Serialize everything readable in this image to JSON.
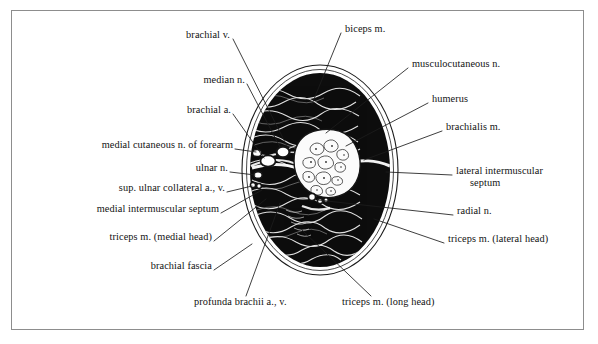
{
  "figure": {
    "type": "anatomical-cross-section",
    "border_color": "#8d8d8d",
    "background_color": "#ffffff",
    "ink_color": "#121212"
  },
  "specimen": {
    "outline_shape": "oval",
    "muscle_fill": "#0d0d0d",
    "fascia_fill": "#ffffff",
    "bone_fill": "#fcfcfc",
    "center_x": 320,
    "center_y": 170,
    "radius_x": 78,
    "radius_y": 105
  },
  "labels": [
    {
      "id": "brachial-v",
      "text": "brachial v.",
      "side": "left",
      "x": 228,
      "y": 35,
      "anchor": "end"
    },
    {
      "id": "median-n",
      "text": "median n.",
      "side": "left",
      "x": 243,
      "y": 80,
      "anchor": "end"
    },
    {
      "id": "brachial-a",
      "text": "brachial a.",
      "side": "left",
      "x": 229,
      "y": 110,
      "anchor": "end"
    },
    {
      "id": "medial-cutaneous-n-forearm",
      "text": "medial cutaneous n. of forearm",
      "side": "left",
      "x": 231,
      "y": 145,
      "anchor": "end"
    },
    {
      "id": "ulnar-n",
      "text": "ulnar n.",
      "side": "left",
      "x": 226,
      "y": 168,
      "anchor": "end"
    },
    {
      "id": "sup-ulnar-collateral",
      "text": "sup. ulnar collateral a., v.",
      "side": "left",
      "x": 223,
      "y": 188,
      "anchor": "end"
    },
    {
      "id": "medial-intermuscular-septum",
      "text": "medial intermuscular septum",
      "side": "left",
      "x": 217,
      "y": 209,
      "anchor": "end"
    },
    {
      "id": "triceps-medial-head",
      "text": "triceps m. (medial head)",
      "side": "left",
      "x": 210,
      "y": 237,
      "anchor": "end"
    },
    {
      "id": "brachial-fascia",
      "text": "brachial fascia",
      "side": "left",
      "x": 210,
      "y": 266,
      "anchor": "end"
    },
    {
      "id": "profunda-brachii",
      "text": "profunda brachii a., v.",
      "side": "bottom",
      "x": 194,
      "y": 302,
      "anchor": "start"
    },
    {
      "id": "triceps-long-head",
      "text": "triceps m. (long head)",
      "side": "bottom",
      "x": 342,
      "y": 302,
      "anchor": "start"
    },
    {
      "id": "biceps-m",
      "text": "biceps m.",
      "side": "right",
      "x": 345,
      "y": 29,
      "anchor": "start"
    },
    {
      "id": "musculocutaneous-n",
      "text": "musculocutaneous n.",
      "side": "right",
      "x": 412,
      "y": 64,
      "anchor": "start"
    },
    {
      "id": "humerus",
      "text": "humerus",
      "side": "right",
      "x": 432,
      "y": 99,
      "anchor": "start"
    },
    {
      "id": "brachialis-m",
      "text": "brachialis m.",
      "side": "right",
      "x": 446,
      "y": 127,
      "anchor": "start"
    },
    {
      "id": "lateral-intermuscular-septum",
      "text": "lateral intermuscular",
      "text2": "septum",
      "side": "right",
      "x": 456,
      "y": 171,
      "anchor": "start"
    },
    {
      "id": "radial-n",
      "text": "radial n.",
      "side": "right",
      "x": 457,
      "y": 211,
      "anchor": "start"
    },
    {
      "id": "triceps-lateral-head",
      "text": "triceps m. (lateral head)",
      "side": "right",
      "x": 448,
      "y": 239,
      "anchor": "start"
    }
  ],
  "structures": [
    {
      "id": "biceps-m",
      "name": "biceps m.",
      "region": "anterior-superior"
    },
    {
      "id": "brachialis-m",
      "name": "brachialis m.",
      "region": "anterior-lateral"
    },
    {
      "id": "humerus",
      "name": "humerus",
      "region": "center"
    },
    {
      "id": "triceps-long-head",
      "name": "triceps m. (long head)",
      "region": "posterior-medial"
    },
    {
      "id": "triceps-lateral-head",
      "name": "triceps m. (lateral head)",
      "region": "posterior-lateral"
    },
    {
      "id": "triceps-medial-head",
      "name": "triceps m. (medial head)",
      "region": "posterior-medial-deep"
    },
    {
      "id": "brachial-fascia",
      "name": "brachial fascia",
      "region": "perimeter"
    },
    {
      "id": "medial-intermuscular-septum",
      "name": "medial intermuscular septum",
      "region": "medial"
    },
    {
      "id": "lateral-intermuscular-septum",
      "name": "lateral intermuscular septum",
      "region": "lateral"
    }
  ]
}
